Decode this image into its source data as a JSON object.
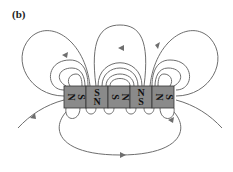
{
  "figure": {
    "panel_label": "(b)"
  },
  "magnets": [
    {
      "index": 0,
      "orientation": "horizontal",
      "left_pole": "N",
      "right_pole": "S"
    },
    {
      "index": 1,
      "orientation": "vertical",
      "top_pole": "S",
      "bottom_pole": "N"
    },
    {
      "index": 2,
      "orientation": "horizontal",
      "left_pole": "S",
      "right_pole": "N"
    },
    {
      "index": 3,
      "orientation": "vertical",
      "top_pole": "N",
      "bottom_pole": "S"
    },
    {
      "index": 4,
      "orientation": "horizontal",
      "left_pole": "N",
      "right_pole": "S"
    }
  ],
  "colors": {
    "magnet_fill": "#8a8a8a",
    "magnet_border": "#333333",
    "field_line": "#6e6e6e",
    "background": "#ffffff"
  }
}
